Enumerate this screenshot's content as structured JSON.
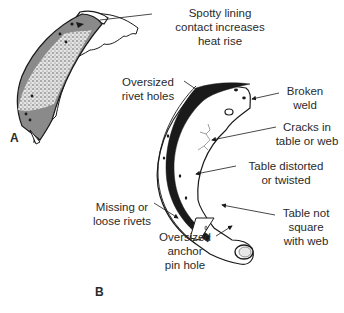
{
  "figure": {
    "panels": [
      {
        "id": "A",
        "label": "A",
        "callouts": [
          {
            "text": "Spotty lining\ncontact increases\nheat rise"
          }
        ]
      },
      {
        "id": "B",
        "label": "B",
        "callouts": [
          {
            "text": "Oversized\nrivet holes"
          },
          {
            "text": "Broken\nweld"
          },
          {
            "text": "Cracks in\ntable or web"
          },
          {
            "text": "Table distorted\nor twisted"
          },
          {
            "text": "Missing or\nloose rivets"
          },
          {
            "text": "Table not\nsquare\nwith web"
          },
          {
            "text": "Oversized\nanchor\npin hole"
          }
        ]
      }
    ]
  },
  "colors": {
    "ink": "#1a1a1a",
    "text": "#2a2a2a",
    "lining_dark": "#8a8a8a",
    "lining_speckle": "#d8d8d8",
    "background": "#ffffff"
  }
}
